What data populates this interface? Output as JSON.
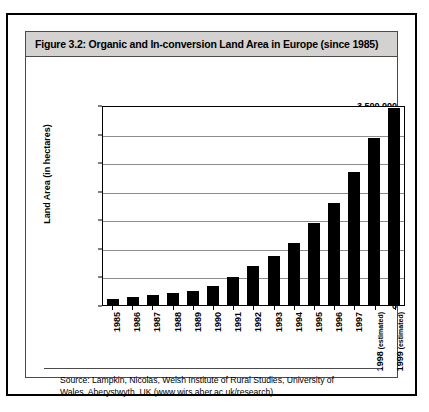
{
  "figure": {
    "title": "Figure 3.2: Organic and In-conversion Land Area in Europe (since 1985)",
    "source_line1": "Source: Lampkin, Nicolas, Welsh Institute of Rural Studies, University of",
    "source_line2": "Wales, Aberystwyth, UK (www.wirs.aber.ac.uk/research)"
  },
  "colors": {
    "bar": "#000000",
    "title_bar": "#d4d2d0",
    "gridline": "#8d8d8d",
    "frame": "#000000"
  },
  "chart_data": {
    "type": "bar",
    "title": "Figure 3.2: Organic and In-conversion Land Area in Europe (since 1985)",
    "xlabel": "",
    "ylabel": "Land Area (in hectares)",
    "ylim": [
      0,
      3500000
    ],
    "ytick_labels": [
      "3,500,000",
      "3,000,000",
      "2,500,000",
      "2,000,000",
      "1,500,000",
      "1,000,000",
      "500,000",
      "0"
    ],
    "ytick_values": [
      3500000,
      3000000,
      2500000,
      2000000,
      1500000,
      1000000,
      500000,
      0
    ],
    "grid": true,
    "legend": "none",
    "categories": [
      "1985",
      "1986",
      "1987",
      "1988",
      "1989",
      "1990",
      "1991",
      "1992",
      "1993",
      "1994",
      "1995",
      "1996",
      "1997",
      "1998",
      "1999"
    ],
    "category_notes": [
      "",
      "",
      "",
      "",
      "",
      "",
      "",
      "",
      "",
      "",
      "",
      "",
      "",
      "(estimated)",
      "(estimated)"
    ],
    "values": [
      110000,
      140000,
      170000,
      210000,
      250000,
      330000,
      490000,
      680000,
      850000,
      1080000,
      1430000,
      1780000,
      2320000,
      2930000,
      3450000
    ]
  }
}
